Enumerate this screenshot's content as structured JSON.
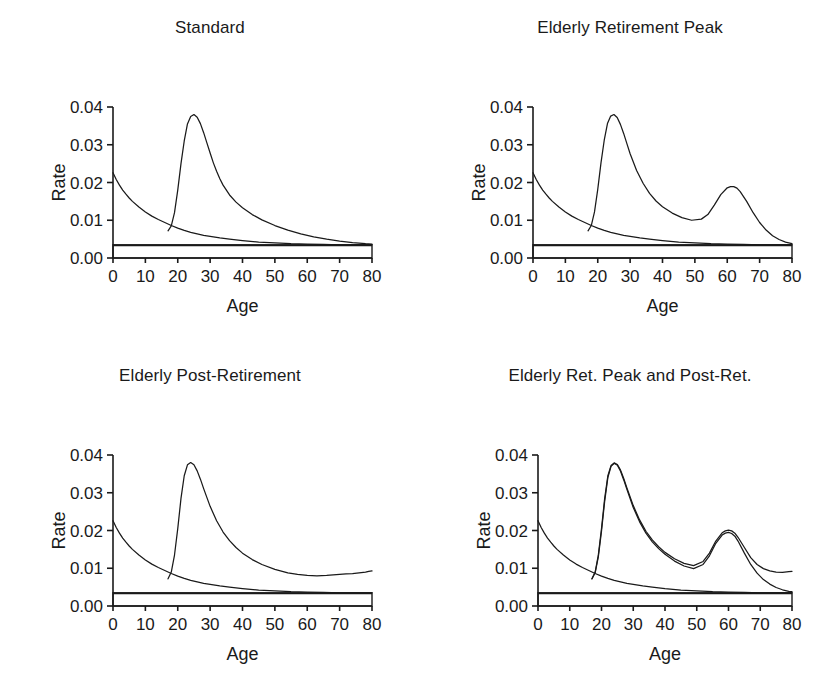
{
  "figure": {
    "background": "#ffffff",
    "ink_color": "#1a1a1a",
    "panel_count": 4,
    "layout": "2x2 grid of line charts"
  },
  "chart_data": [
    {
      "type": "line",
      "title": "Standard",
      "xlabel": "Age",
      "ylabel": "Rate",
      "xlim": [
        0,
        80
      ],
      "ylim": [
        0.0,
        0.04
      ],
      "xticks": [
        0,
        10,
        20,
        30,
        40,
        50,
        60,
        70,
        80
      ],
      "xticklabels": [
        "0",
        "10",
        "20",
        "30",
        "40",
        "50",
        "60",
        "70",
        "80"
      ],
      "yticks": [
        0.0,
        0.01,
        0.02,
        0.03,
        0.04
      ],
      "yticklabels": [
        "0.00",
        "0.01",
        "0.02",
        "0.03",
        "0.04"
      ],
      "grid": false,
      "legend": "none",
      "series": [
        {
          "name": "background-mortality-decay",
          "x": [
            0,
            1,
            2,
            3,
            4,
            5,
            6,
            8,
            10,
            12,
            14,
            16,
            18,
            20,
            22,
            24,
            26,
            28,
            30,
            33,
            36,
            40,
            45,
            50,
            55,
            60,
            65,
            70,
            75,
            80
          ],
          "values": [
            0.0226,
            0.0208,
            0.0193,
            0.018,
            0.0169,
            0.0159,
            0.015,
            0.0135,
            0.0122,
            0.0111,
            0.0102,
            0.0094,
            0.0086,
            0.0079,
            0.0073,
            0.0068,
            0.0064,
            0.006,
            0.0057,
            0.0053,
            0.005,
            0.0046,
            0.0042,
            0.004,
            0.0038,
            0.0037,
            0.0036,
            0.0035,
            0.0035,
            0.0035
          ]
        },
        {
          "name": "young-adult-migration-peak",
          "x": [
            17,
            18,
            19,
            20,
            21,
            22,
            23,
            24,
            25,
            26,
            27,
            28,
            29,
            30,
            31,
            32,
            33,
            34,
            36,
            38,
            40,
            43,
            46,
            50,
            54,
            58,
            62,
            66,
            70,
            74,
            78,
            80
          ],
          "values": [
            0.0072,
            0.0085,
            0.012,
            0.018,
            0.025,
            0.031,
            0.0355,
            0.0375,
            0.038,
            0.0373,
            0.0356,
            0.0332,
            0.0305,
            0.0278,
            0.0252,
            0.023,
            0.021,
            0.0193,
            0.0167,
            0.0148,
            0.0133,
            0.0115,
            0.0101,
            0.0086,
            0.0074,
            0.0064,
            0.0056,
            0.005,
            0.0045,
            0.0041,
            0.0038,
            0.0037
          ]
        },
        {
          "name": "constant-baseline-rate",
          "x": [
            0,
            80
          ],
          "values": [
            0.0033,
            0.0033
          ]
        }
      ]
    },
    {
      "type": "line",
      "title": "Elderly Retirement Peak",
      "xlabel": "Age",
      "ylabel": "Rate",
      "xlim": [
        0,
        80
      ],
      "ylim": [
        0.0,
        0.04
      ],
      "xticks": [
        0,
        10,
        20,
        30,
        40,
        50,
        60,
        70,
        80
      ],
      "xticklabels": [
        "0",
        "10",
        "20",
        "30",
        "40",
        "50",
        "60",
        "70",
        "80"
      ],
      "yticks": [
        0.0,
        0.01,
        0.02,
        0.03,
        0.04
      ],
      "yticklabels": [
        "0.00",
        "0.01",
        "0.02",
        "0.03",
        "0.04"
      ],
      "grid": false,
      "legend": "none",
      "series": [
        {
          "name": "background-mortality-decay",
          "x": [
            0,
            1,
            2,
            3,
            4,
            5,
            6,
            8,
            10,
            12,
            14,
            16,
            18,
            20,
            22,
            24,
            26,
            28,
            30,
            33,
            36,
            40,
            45,
            50,
            55,
            60,
            65,
            70,
            75,
            80
          ],
          "values": [
            0.0226,
            0.0208,
            0.0193,
            0.018,
            0.0169,
            0.0159,
            0.015,
            0.0135,
            0.0122,
            0.0111,
            0.0102,
            0.0094,
            0.0086,
            0.0079,
            0.0073,
            0.0068,
            0.0064,
            0.006,
            0.0057,
            0.0053,
            0.005,
            0.0046,
            0.0042,
            0.004,
            0.0038,
            0.0037,
            0.0036,
            0.0035,
            0.0035,
            0.0035
          ]
        },
        {
          "name": "young-adult-plus-retirement-peak",
          "x": [
            17,
            18,
            19,
            20,
            21,
            22,
            23,
            24,
            25,
            26,
            27,
            28,
            29,
            30,
            32,
            34,
            36,
            38,
            40,
            43,
            46,
            49,
            52,
            54,
            56,
            58,
            60,
            61,
            62,
            63,
            64,
            66,
            68,
            70,
            72,
            74,
            76,
            78,
            80
          ],
          "values": [
            0.0072,
            0.0086,
            0.0122,
            0.0182,
            0.0252,
            0.0312,
            0.0356,
            0.0376,
            0.038,
            0.0372,
            0.0354,
            0.033,
            0.0303,
            0.0276,
            0.0232,
            0.0198,
            0.0171,
            0.0151,
            0.0136,
            0.0119,
            0.0107,
            0.01,
            0.0103,
            0.0115,
            0.014,
            0.0168,
            0.0186,
            0.0189,
            0.0189,
            0.0185,
            0.0176,
            0.015,
            0.012,
            0.0094,
            0.0074,
            0.0059,
            0.0049,
            0.0042,
            0.0038
          ]
        },
        {
          "name": "constant-baseline-rate",
          "x": [
            0,
            80
          ],
          "values": [
            0.0033,
            0.0033
          ]
        }
      ]
    },
    {
      "type": "line",
      "title": "Elderly Post-Retirement",
      "xlabel": "Age",
      "ylabel": "Rate",
      "xlim": [
        0,
        80
      ],
      "ylim": [
        0.0,
        0.04
      ],
      "xticks": [
        0,
        10,
        20,
        30,
        40,
        50,
        60,
        70,
        80
      ],
      "xticklabels": [
        "0",
        "10",
        "20",
        "30",
        "40",
        "50",
        "60",
        "70",
        "80"
      ],
      "yticks": [
        0.0,
        0.01,
        0.02,
        0.03,
        0.04
      ],
      "yticklabels": [
        "0.00",
        "0.01",
        "0.02",
        "0.03",
        "0.04"
      ],
      "grid": false,
      "legend": "none",
      "series": [
        {
          "name": "background-mortality-decay",
          "x": [
            0,
            1,
            2,
            3,
            4,
            5,
            6,
            8,
            10,
            12,
            14,
            16,
            18,
            20,
            22,
            24,
            26,
            28,
            30,
            33,
            36,
            40,
            45,
            50,
            55,
            60,
            65,
            70,
            75,
            80
          ],
          "values": [
            0.0226,
            0.0208,
            0.0193,
            0.018,
            0.0169,
            0.0159,
            0.015,
            0.0135,
            0.0122,
            0.0111,
            0.0102,
            0.0094,
            0.0086,
            0.0079,
            0.0073,
            0.0068,
            0.0064,
            0.006,
            0.0057,
            0.0053,
            0.005,
            0.0046,
            0.0042,
            0.004,
            0.0038,
            0.0037,
            0.0036,
            0.0035,
            0.0035,
            0.0035
          ]
        },
        {
          "name": "young-adult-plus-post-retirement-rise",
          "x": [
            17,
            18,
            19,
            20,
            21,
            22,
            23,
            24,
            25,
            26,
            27,
            28,
            30,
            32,
            34,
            36,
            38,
            40,
            43,
            46,
            50,
            54,
            57,
            60,
            63,
            66,
            69,
            72,
            74,
            76,
            78,
            79,
            80
          ],
          "values": [
            0.0072,
            0.009,
            0.0135,
            0.0205,
            0.0285,
            0.0345,
            0.0374,
            0.038,
            0.0374,
            0.0358,
            0.0336,
            0.0311,
            0.0264,
            0.0226,
            0.0196,
            0.0173,
            0.0155,
            0.014,
            0.0123,
            0.011,
            0.0097,
            0.0088,
            0.0084,
            0.0081,
            0.008,
            0.0081,
            0.0083,
            0.0085,
            0.0086,
            0.0088,
            0.009,
            0.0092,
            0.0093
          ]
        },
        {
          "name": "constant-baseline-rate",
          "x": [
            0,
            80
          ],
          "values": [
            0.0033,
            0.0033
          ]
        }
      ]
    },
    {
      "type": "line",
      "title": "Elderly Ret. Peak and Post-Ret.",
      "xlabel": "Age",
      "ylabel": "Rate",
      "xlim": [
        0,
        80
      ],
      "ylim": [
        0.0,
        0.04
      ],
      "xticks": [
        0,
        10,
        20,
        30,
        40,
        50,
        60,
        70,
        80
      ],
      "xticklabels": [
        "0",
        "10",
        "20",
        "30",
        "40",
        "50",
        "60",
        "70",
        "80"
      ],
      "yticks": [
        0.0,
        0.01,
        0.02,
        0.03,
        0.04
      ],
      "yticklabels": [
        "0.00",
        "0.01",
        "0.02",
        "0.03",
        "0.04"
      ],
      "grid": false,
      "legend": "none",
      "series": [
        {
          "name": "background-mortality-decay",
          "x": [
            0,
            1,
            2,
            3,
            4,
            5,
            6,
            8,
            10,
            12,
            14,
            16,
            18,
            20,
            22,
            24,
            26,
            28,
            30,
            33,
            36,
            40,
            45,
            50,
            55,
            60,
            65,
            70,
            75,
            80
          ],
          "values": [
            0.0226,
            0.0208,
            0.0193,
            0.018,
            0.0169,
            0.0159,
            0.015,
            0.0135,
            0.0122,
            0.0111,
            0.0102,
            0.0094,
            0.0086,
            0.0079,
            0.0073,
            0.0068,
            0.0064,
            0.006,
            0.0057,
            0.0053,
            0.005,
            0.0046,
            0.0042,
            0.004,
            0.0038,
            0.0037,
            0.0036,
            0.0035,
            0.0035,
            0.0035
          ]
        },
        {
          "name": "combined-peak-and-post-retirement",
          "x": [
            17,
            18,
            19,
            20,
            21,
            22,
            23,
            24,
            25,
            26,
            27,
            28,
            30,
            32,
            34,
            36,
            38,
            40,
            43,
            46,
            49,
            52,
            54,
            56,
            58,
            59,
            60,
            61,
            62,
            63,
            65,
            67,
            69,
            71,
            73,
            75,
            77,
            79,
            80
          ],
          "values": [
            0.0072,
            0.009,
            0.0135,
            0.0205,
            0.0285,
            0.0345,
            0.0372,
            0.0379,
            0.0375,
            0.036,
            0.0338,
            0.0313,
            0.0266,
            0.0228,
            0.0198,
            0.0175,
            0.0157,
            0.0142,
            0.0125,
            0.0113,
            0.0107,
            0.0118,
            0.014,
            0.0172,
            0.0194,
            0.0199,
            0.0201,
            0.0199,
            0.0193,
            0.0182,
            0.0155,
            0.0128,
            0.011,
            0.0099,
            0.0093,
            0.009,
            0.0089,
            0.0091,
            0.0092
          ]
        },
        {
          "name": "retirement-peak-decaying",
          "x": [
            17,
            18,
            19,
            20,
            21,
            22,
            23,
            24,
            25,
            26,
            27,
            28,
            30,
            32,
            34,
            36,
            38,
            40,
            43,
            46,
            49,
            52,
            54,
            56,
            58,
            59,
            60,
            61,
            62,
            63,
            65,
            67,
            69,
            71,
            73,
            75,
            77,
            79,
            80
          ],
          "values": [
            0.0072,
            0.0088,
            0.013,
            0.0198,
            0.0278,
            0.034,
            0.037,
            0.0378,
            0.0373,
            0.0357,
            0.0334,
            0.0309,
            0.0261,
            0.0223,
            0.0193,
            0.017,
            0.0152,
            0.0137,
            0.0119,
            0.0106,
            0.0099,
            0.011,
            0.0133,
            0.0166,
            0.0188,
            0.0193,
            0.0195,
            0.0192,
            0.0185,
            0.0172,
            0.014,
            0.011,
            0.0087,
            0.007,
            0.0058,
            0.0049,
            0.0043,
            0.0039,
            0.0038
          ]
        },
        {
          "name": "constant-baseline-rate",
          "x": [
            0,
            80
          ],
          "values": [
            0.0033,
            0.0033
          ]
        }
      ]
    }
  ]
}
